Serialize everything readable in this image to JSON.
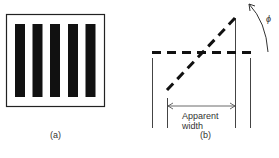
{
  "figure": {
    "panel_a": {
      "caption": "(a)",
      "bar_count": 5,
      "description": "Square frame containing five vertical black bars (grating)"
    },
    "panel_b": {
      "caption": "(b)",
      "dimension_label_line1": "Apparent",
      "dimension_label_line2": "width",
      "angle_label": "ϕ",
      "description": "Horizontal dashed grating edge and rotated dashed grating with arrow showing rotation angle and reduced apparent width"
    }
  },
  "colors": {
    "ink": "#111111",
    "line": "#333333",
    "background": "#ffffff"
  }
}
